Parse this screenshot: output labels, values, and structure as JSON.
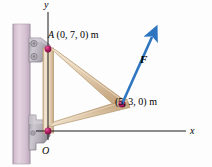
{
  "figure": {
    "type": "statics-free-body-diagram",
    "background_color": "#fdfdfd"
  },
  "axes": {
    "y_label": "y",
    "x_label": "x",
    "origin_label": "O",
    "axis_color": "#1a1a1a"
  },
  "labels": {
    "point_A_name": "A",
    "point_A_coords": "(0, 7, 0) m",
    "point_B_coords": "(5, 3, 0) m",
    "force_label": "F"
  },
  "colors": {
    "member": "#e9d7bd",
    "member_shade": "#d8bf9d",
    "member_edge": "#b89c74",
    "wall": "#dbc9d6",
    "wall_edge": "#b9a6b6",
    "bracket": "#b8b2bc",
    "bracket_dark": "#8d8894",
    "pin": "#a8185a",
    "force_arrow": "#2e75c0"
  },
  "geometry": {
    "origin_px": [
      48,
      131
    ],
    "point_A_px": [
      48,
      49
    ],
    "point_B_px": [
      122,
      104
    ],
    "force_tip_px": [
      155,
      34
    ],
    "x_axis_end_px": [
      186,
      131
    ],
    "y_axis_top_px": [
      48,
      12
    ]
  }
}
